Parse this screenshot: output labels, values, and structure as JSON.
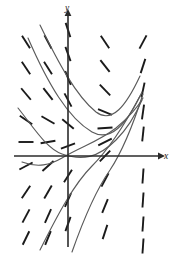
{
  "figure": {
    "background_color": "#ffffff",
    "axis_color": "#2b2b2b",
    "dash_color": "#1a1a1a",
    "curve_color": "#5a5a5a"
  },
  "axes": {
    "origin": {
      "x": 68,
      "y": 156
    },
    "x_axis": {
      "x1": 14,
      "y1": 156,
      "x2": 158,
      "y2": 156,
      "label": "x",
      "label_x": 164,
      "label_y": 159
    },
    "y_axis": {
      "x1": 68,
      "y1": 247,
      "x2": 68,
      "y2": 16,
      "label": "y",
      "label_x": 67,
      "label_y": 11
    }
  },
  "chart_data": {
    "type": "line",
    "xlabel": "x",
    "ylabel": "y",
    "grid": false,
    "legend": null,
    "slope_marks": [
      {
        "cx": 26,
        "cy": 42,
        "angle": -58
      },
      {
        "cx": 26,
        "cy": 68,
        "angle": -56
      },
      {
        "cx": 26,
        "cy": 94,
        "angle": -50
      },
      {
        "cx": 26,
        "cy": 120,
        "angle": -34
      },
      {
        "cx": 26,
        "cy": 142,
        "angle": 0
      },
      {
        "cx": 26,
        "cy": 166,
        "angle": 28
      },
      {
        "cx": 26,
        "cy": 192,
        "angle": 56
      },
      {
        "cx": 26,
        "cy": 216,
        "angle": 62
      },
      {
        "cx": 26,
        "cy": 238,
        "angle": 64
      },
      {
        "cx": 48,
        "cy": 42,
        "angle": -62
      },
      {
        "cx": 48,
        "cy": 68,
        "angle": -58
      },
      {
        "cx": 48,
        "cy": 94,
        "angle": -52
      },
      {
        "cx": 48,
        "cy": 120,
        "angle": -30
      },
      {
        "cx": 48,
        "cy": 142,
        "angle": 10
      },
      {
        "cx": 48,
        "cy": 166,
        "angle": 42
      },
      {
        "cx": 48,
        "cy": 192,
        "angle": 60
      },
      {
        "cx": 48,
        "cy": 216,
        "angle": 66
      },
      {
        "cx": 48,
        "cy": 238,
        "angle": 68
      },
      {
        "cx": 68,
        "cy": 30,
        "angle": -72
      },
      {
        "cx": 68,
        "cy": 54,
        "angle": -70
      },
      {
        "cx": 68,
        "cy": 78,
        "angle": -68
      },
      {
        "cx": 68,
        "cy": 100,
        "angle": -62
      },
      {
        "cx": 68,
        "cy": 124,
        "angle": -40
      },
      {
        "cx": 68,
        "cy": 146,
        "angle": 20
      },
      {
        "cx": 68,
        "cy": 176,
        "angle": 58
      },
      {
        "cx": 68,
        "cy": 200,
        "angle": 66
      },
      {
        "cx": 68,
        "cy": 224,
        "angle": 70
      },
      {
        "cx": 105,
        "cy": 42,
        "angle": -56
      },
      {
        "cx": 105,
        "cy": 66,
        "angle": -52
      },
      {
        "cx": 105,
        "cy": 90,
        "angle": -46
      },
      {
        "cx": 105,
        "cy": 112,
        "angle": -22
      },
      {
        "cx": 105,
        "cy": 128,
        "angle": 4
      },
      {
        "cx": 105,
        "cy": 142,
        "angle": 26
      },
      {
        "cx": 105,
        "cy": 156,
        "angle": 46
      },
      {
        "cx": 105,
        "cy": 180,
        "angle": 62
      },
      {
        "cx": 105,
        "cy": 206,
        "angle": 68
      },
      {
        "cx": 105,
        "cy": 232,
        "angle": 72
      },
      {
        "cx": 143,
        "cy": 42,
        "angle": 62
      },
      {
        "cx": 143,
        "cy": 66,
        "angle": 72
      },
      {
        "cx": 143,
        "cy": 90,
        "angle": 78
      },
      {
        "cx": 143,
        "cy": 112,
        "angle": 82
      },
      {
        "cx": 143,
        "cy": 134,
        "angle": 84
      },
      {
        "cx": 143,
        "cy": 176,
        "angle": 86
      },
      {
        "cx": 143,
        "cy": 200,
        "angle": 86
      },
      {
        "cx": 143,
        "cy": 224,
        "angle": 86
      },
      {
        "cx": 143,
        "cy": 246,
        "angle": 86
      }
    ],
    "dash_length": 15,
    "curves": [
      {
        "name": "curve-1",
        "path": "M 40,25 C 58,62 76,96 96,112 C 112,124 126,106 140,76"
      },
      {
        "name": "curve-2",
        "path": "M 28,38 C 48,84 68,118 92,132 C 110,142 126,126 142,92"
      },
      {
        "name": "curve-3",
        "path": "M 18,108 C 34,128 46,148 62,154 C 82,161 98,158 116,140 C 128,128 136,114 142,100"
      },
      {
        "name": "curve-4",
        "path": "M 22,162 C 38,168 50,165 62,158 C 82,146 98,142 116,128 C 128,118 136,110 143,98"
      },
      {
        "name": "curve-5",
        "path": "M 40,250 C 58,214 74,184 92,166 C 108,150 124,126 140,96"
      },
      {
        "name": "curve-6",
        "path": "M 72,252 C 84,218 96,190 110,170 C 122,152 134,122 143,94"
      }
    ]
  }
}
